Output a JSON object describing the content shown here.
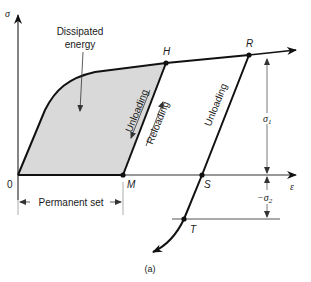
{
  "diagram": {
    "type": "stress-strain hysteresis",
    "caption": "(a)",
    "axes": {
      "y_label": "σ",
      "x_label": "ε",
      "origin_label": "0"
    },
    "points": {
      "H": "H",
      "R": "R",
      "M": "M",
      "S": "S",
      "T": "T"
    },
    "annotations": {
      "dissipated_line1": "Dissipated",
      "dissipated_line2": "energy",
      "unloading_left": "Unloading",
      "reloading": "Reloading",
      "unloading_right": "Unloading",
      "permanent_set": "Permanent set",
      "sigma1": "σ",
      "sigma1_sub": "1",
      "sigma2": "−σ",
      "sigma2_sub": "2"
    },
    "colors": {
      "curve": "#111111",
      "fill": "#d9d9d9",
      "thin": "#555555"
    }
  }
}
